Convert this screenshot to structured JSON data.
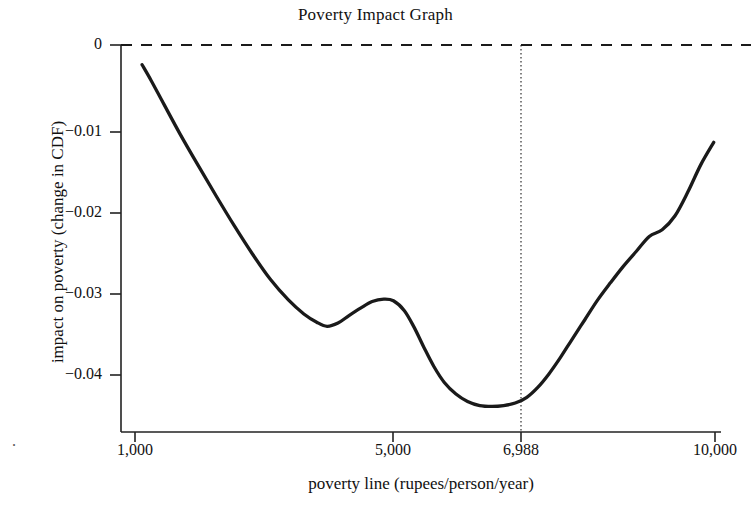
{
  "chart_data": {
    "type": "line",
    "title": "Poverty Impact Graph",
    "xlabel": "poverty line (rupees/person/year)",
    "ylabel": "impact on poverty (change in CDF)",
    "xlim": [
      1000,
      10000
    ],
    "ylim": [
      -0.0475,
      0
    ],
    "grid": false,
    "legend": null,
    "x_ticks": [
      {
        "value": 1000,
        "label": "1,000"
      },
      {
        "value": 5000,
        "label": "5,000"
      },
      {
        "value": 6988,
        "label": "6,988"
      },
      {
        "value": 10000,
        "label": "10,000"
      }
    ],
    "y_ticks": [
      {
        "value": 0,
        "label": "0"
      },
      {
        "value": -0.01,
        "label": "−0.01"
      },
      {
        "value": -0.02,
        "label": "−0.02"
      },
      {
        "value": -0.03,
        "label": "−0.03"
      },
      {
        "value": -0.04,
        "label": "−0.04"
      }
    ],
    "annotations": [
      {
        "name": "zero-reference-line",
        "type": "hline",
        "y": 0,
        "style": "dashed"
      },
      {
        "name": "poverty-line-marker",
        "type": "vline",
        "x": 6988,
        "style": "dotted",
        "label": "6,988"
      }
    ],
    "series": [
      {
        "name": "impact on poverty",
        "color": "#1a1a1a",
        "x": [
          1110,
          1250,
          1450,
          1700,
          1980,
          2260,
          2540,
          2820,
          3100,
          3380,
          3620,
          3820,
          3980,
          4150,
          4320,
          4500,
          4680,
          4860,
          5010,
          5180,
          5330,
          5480,
          5640,
          5800,
          5980,
          6160,
          6350,
          6540,
          6720,
          6900,
          7080,
          7250,
          7420,
          7600,
          7780,
          7980,
          8180,
          8380,
          8580,
          8780,
          8980,
          9180,
          9380,
          9580,
          9780,
          9980
        ],
        "y": [
          -0.0024,
          -0.0043,
          -0.0072,
          -0.0108,
          -0.0146,
          -0.0183,
          -0.0219,
          -0.0253,
          -0.0284,
          -0.0309,
          -0.0326,
          -0.0336,
          -0.0341,
          -0.0337,
          -0.0328,
          -0.0319,
          -0.0311,
          -0.0308,
          -0.031,
          -0.0322,
          -0.0342,
          -0.0366,
          -0.039,
          -0.0409,
          -0.0423,
          -0.0432,
          -0.0437,
          -0.0438,
          -0.0437,
          -0.0434,
          -0.0427,
          -0.0415,
          -0.0399,
          -0.0379,
          -0.0357,
          -0.0333,
          -0.0309,
          -0.0288,
          -0.0268,
          -0.025,
          -0.0232,
          -0.0224,
          -0.0207,
          -0.0178,
          -0.0145,
          -0.0118
        ]
      }
    ]
  },
  "axes": {
    "spine_color": "#222222",
    "line_color": "#1a1a1a"
  },
  "decorations": {
    "corner_mark": "."
  }
}
